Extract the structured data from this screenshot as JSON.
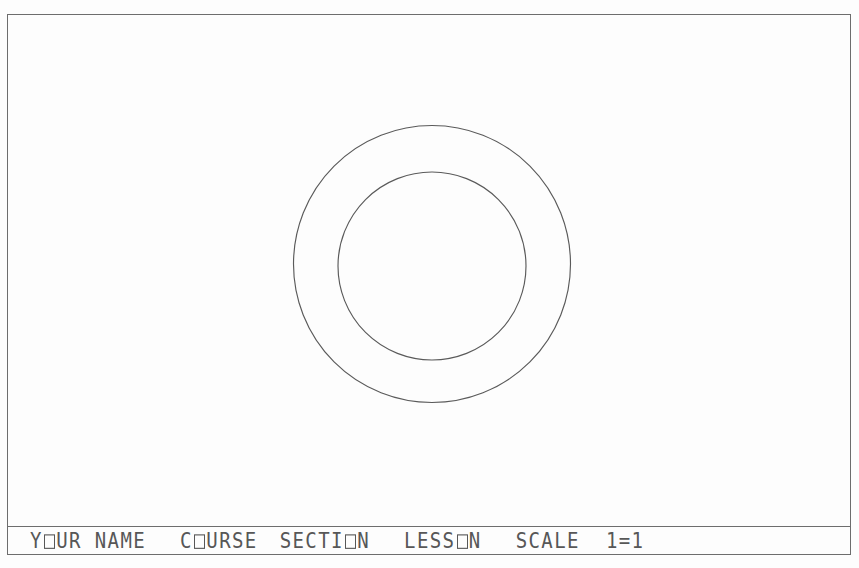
{
  "sheet": {
    "background_color": "#fdfdfd",
    "line_color": "#6d6d6d",
    "text_color": "#575757"
  },
  "drawing": {
    "name": "concentric-circles-annulus",
    "description": "Two concentric circles forming an annulus (washer / ring) view",
    "outer_circle": {
      "center_x": 431,
      "center_y": 263,
      "diameter": 277
    },
    "inner_circle": {
      "center_x": 431,
      "center_y": 265,
      "diameter": 188
    }
  },
  "title_block": {
    "name_field": "YOUR NAME",
    "course_field": "COURSE",
    "section_field": "SECTION",
    "lesson_field": "LESSON",
    "scale_label": "SCALE",
    "scale_value": "1=1",
    "name_part1": "Y",
    "name_part2": "UR NAME",
    "course_part1": "C",
    "course_part2": "URSE",
    "section_part1": "SECTI",
    "section_part2": "N",
    "lesson_part1": "LESS",
    "lesson_part2": "N"
  }
}
